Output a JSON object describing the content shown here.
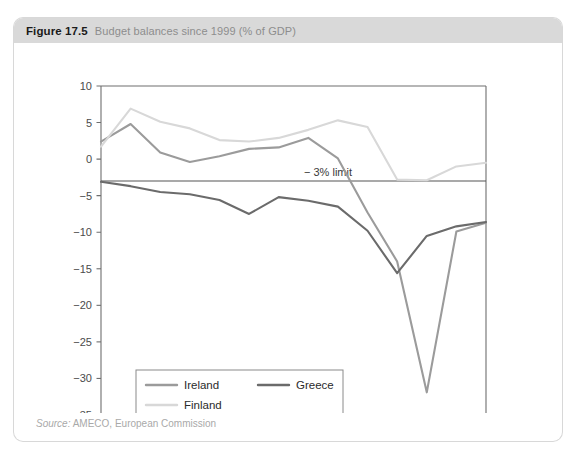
{
  "figure": {
    "number": "Figure 17.5",
    "caption": "Budget balances since 1999 (% of GDP)",
    "source_label": "Source:",
    "source_text": "AMECO, European Commission"
  },
  "legend": {
    "items": [
      {
        "label": "Ireland",
        "color": "#9b9b9b"
      },
      {
        "label": "Greece",
        "color": "#6b6b6b"
      },
      {
        "label": "Finland",
        "color": "#d8d8d8"
      }
    ]
  },
  "annotations": {
    "limit_label": "− 3% limit",
    "limit_value": -3
  },
  "chart_data": {
    "type": "line",
    "title": "Budget balances since 1999 (% of GDP)",
    "xlabel": "",
    "ylabel": "",
    "x": [
      1999,
      2000,
      2001,
      2002,
      2003,
      2004,
      2005,
      2006,
      2007,
      2008,
      2009,
      2010,
      2011,
      2012
    ],
    "categories": [
      "1999",
      "2000",
      "2001",
      "2002",
      "2003",
      "2004",
      "2005",
      "2006",
      "2007",
      "2008",
      "2009",
      "2010",
      "2011",
      "2012"
    ],
    "xlim": [
      1999,
      2012
    ],
    "ylim": [
      -35,
      10
    ],
    "yticks": [
      10,
      5,
      0,
      -5,
      -10,
      -15,
      -20,
      -25,
      -30,
      -35
    ],
    "ytick_labels": [
      "10",
      "5",
      "0",
      "−5",
      "−10",
      "−15",
      "−20",
      "−25",
      "−30",
      "−35"
    ],
    "grid": false,
    "legend_position": "bottom-left",
    "reference_lines": [
      {
        "value": -3,
        "label": "− 3% limit",
        "color": "#555555"
      }
    ],
    "series": [
      {
        "name": "Ireland",
        "color": "#9b9b9b",
        "values": [
          2.4,
          4.8,
          0.9,
          -0.4,
          0.4,
          1.4,
          1.6,
          2.9,
          0.1,
          -7.3,
          -14.0,
          -31.9,
          -9.9,
          -8.7
        ]
      },
      {
        "name": "Greece",
        "color": "#6b6b6b",
        "values": [
          -3.1,
          -3.7,
          -4.5,
          -4.8,
          -5.6,
          -7.5,
          -5.2,
          -5.7,
          -6.5,
          -9.8,
          -15.6,
          -10.5,
          -9.2,
          -8.6
        ]
      },
      {
        "name": "Finland",
        "color": "#d8d8d8",
        "values": [
          1.7,
          6.9,
          5.1,
          4.2,
          2.6,
          2.4,
          2.9,
          4.0,
          5.3,
          4.4,
          -2.8,
          -2.9,
          -1.0,
          -0.5
        ]
      }
    ]
  }
}
